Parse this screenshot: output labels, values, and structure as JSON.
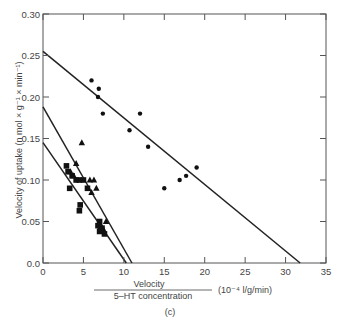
{
  "chart_data": {
    "type": "scatter",
    "title": "",
    "panel_label": "(c)",
    "xlabel_numerator": "Velocity",
    "xlabel_denominator": "5–HT concentration",
    "xlabel_units": "(10⁻⁴  l/g/min)",
    "ylabel": "Velocity of uptake (n mol × g⁻¹ × min⁻¹)",
    "xlim": [
      0,
      35
    ],
    "ylim": [
      0,
      0.3
    ],
    "xticks": [
      "0",
      "5",
      "10",
      "15",
      "20",
      "25",
      "30",
      "35"
    ],
    "yticks": [
      "0.0",
      "0.05",
      "0.10",
      "0.15",
      "0.20",
      "0.25",
      "0.30"
    ],
    "grid": false,
    "legend": "none",
    "series": [
      {
        "name": "circles",
        "marker": "circle",
        "points": [
          [
            6.0,
            0.22
          ],
          [
            6.9,
            0.21
          ],
          [
            6.8,
            0.2
          ],
          [
            7.4,
            0.18
          ],
          [
            12.0,
            0.18
          ],
          [
            10.7,
            0.16
          ],
          [
            13.0,
            0.14
          ],
          [
            15.0,
            0.09
          ],
          [
            16.9,
            0.1
          ],
          [
            17.7,
            0.105
          ],
          [
            19.0,
            0.115
          ]
        ],
        "fit_line": [
          [
            0,
            0.255
          ],
          [
            31.8,
            0
          ]
        ]
      },
      {
        "name": "triangles",
        "marker": "triangle",
        "points": [
          [
            3.4,
            0.11
          ],
          [
            3.8,
            0.105
          ],
          [
            4.1,
            0.12
          ],
          [
            4.8,
            0.145
          ],
          [
            5.8,
            0.1
          ],
          [
            6.3,
            0.1
          ],
          [
            6.6,
            0.09
          ],
          [
            6.0,
            0.085
          ],
          [
            7.2,
            0.045
          ],
          [
            7.8,
            0.05
          ],
          [
            7.5,
            0.04
          ]
        ],
        "fit_line": [
          [
            0,
            0.188
          ],
          [
            11.0,
            0
          ]
        ]
      },
      {
        "name": "squares",
        "marker": "square",
        "points": [
          [
            2.9,
            0.117
          ],
          [
            3.1,
            0.11
          ],
          [
            3.3,
            0.09
          ],
          [
            3.6,
            0.105
          ],
          [
            4.1,
            0.1
          ],
          [
            4.5,
            0.1
          ],
          [
            5.0,
            0.1
          ],
          [
            4.6,
            0.07
          ],
          [
            4.5,
            0.063
          ],
          [
            5.5,
            0.09
          ],
          [
            7.0,
            0.05
          ],
          [
            6.8,
            0.045
          ],
          [
            7.0,
            0.038
          ],
          [
            7.3,
            0.042
          ],
          [
            7.6,
            0.035
          ],
          [
            7.1,
            0.04
          ]
        ],
        "fit_line": [
          [
            0,
            0.145
          ],
          [
            10.3,
            0
          ]
        ]
      }
    ]
  }
}
